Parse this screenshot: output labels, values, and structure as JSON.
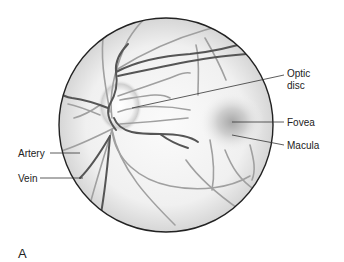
{
  "figure": {
    "panel_label": "A",
    "labels": {
      "optic_disc_line1": "Optic",
      "optic_disc_line2": "disc",
      "fovea": "Fovea",
      "macula": "Macula",
      "artery": "Artery",
      "vein": "Vein"
    },
    "colors": {
      "outline": "#222222",
      "vein": "#555555",
      "artery": "#9a9a9a",
      "background": "#ffffff",
      "fundus_fill": "#f2f2f2",
      "macula_shade": "#b8b8b8"
    }
  }
}
